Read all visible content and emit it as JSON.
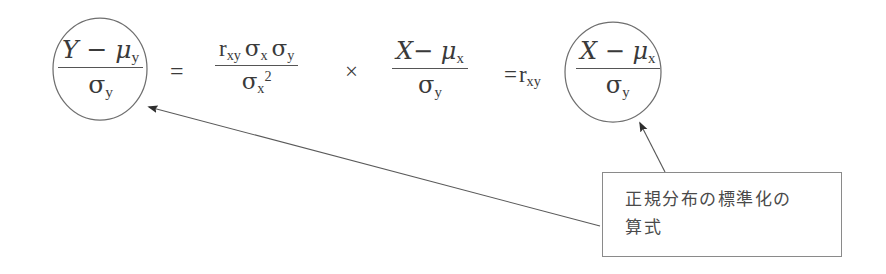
{
  "figure": {
    "background_color": "#ffffff",
    "ink_color": "#3a3a3a",
    "line_color": "#8a8a8a"
  },
  "equation": {
    "left_term": {
      "numerator": "Y − μ",
      "numerator_sub": "y",
      "denominator": "σ",
      "denominator_sub": "y",
      "circled": true
    },
    "equals_1": "=",
    "middle_term": {
      "numerator_r": "r",
      "numerator_r_sub": "xy",
      "numerator_s1": "σ",
      "numerator_s1_sub": "x",
      "numerator_s2": "σ",
      "numerator_s2_sub": "y",
      "denominator": "σ",
      "denominator_sub": "x",
      "denominator_sup": "2"
    },
    "times": "×",
    "third_term": {
      "numerator": "X− μ",
      "numerator_sub": "x",
      "denominator": "σ",
      "denominator_sub": "y"
    },
    "equals_2": "=",
    "coefficient": "r",
    "coefficient_sub": "xy",
    "result_term": {
      "numerator": "X − μ",
      "numerator_sub": "x",
      "denominator": "σ",
      "denominator_sub": "y",
      "circled": true
    }
  },
  "annotation": {
    "line1": "正規分布の標準化の",
    "line2": "算式",
    "full_text": "正規分布の標準化の算式"
  },
  "shapes": {
    "circle_left": {
      "cx": 100,
      "cy": 69,
      "rx": 47,
      "ry": 51
    },
    "circle_right": {
      "cx": 613,
      "cy": 72,
      "rx": 48,
      "ry": 50
    },
    "arrow_long": {
      "from_x": 600,
      "from_y": 226,
      "to_x": 146,
      "to_y": 106
    },
    "arrow_short": {
      "from_x": 665,
      "from_y": 172,
      "to_x": 638,
      "to_y": 121
    }
  }
}
